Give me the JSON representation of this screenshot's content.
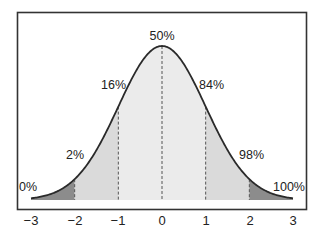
{
  "chart_data": {
    "type": "area",
    "title": "",
    "xlabel": "",
    "ylabel": "",
    "xlim": [
      -3,
      3
    ],
    "x_ticks": [
      -3,
      -2,
      -1,
      0,
      1,
      2,
      3
    ],
    "x_tick_labels": [
      "−3",
      "−2",
      "−1",
      "0",
      "1",
      "2",
      "3"
    ],
    "grid": false,
    "legend": null,
    "region_boundaries": [
      -2,
      -1,
      0,
      1,
      2
    ],
    "regions": [
      {
        "from": -3,
        "to": -2,
        "color": "#8c8c8c"
      },
      {
        "from": -2,
        "to": -1,
        "color": "#dadada"
      },
      {
        "from": -1,
        "to": 0,
        "color": "#ebebeb"
      },
      {
        "from": 0,
        "to": 1,
        "color": "#ebebeb"
      },
      {
        "from": 1,
        "to": 2,
        "color": "#dadada"
      },
      {
        "from": 2,
        "to": 3,
        "color": "#8c8c8c"
      }
    ],
    "percentile_annotations": [
      {
        "z": -3,
        "label": "0%"
      },
      {
        "z": -2,
        "label": "2%"
      },
      {
        "z": -1,
        "label": "16%"
      },
      {
        "z": 0,
        "label": "50%"
      },
      {
        "z": 1,
        "label": "84%"
      },
      {
        "z": 2,
        "label": "98%"
      },
      {
        "z": 3,
        "label": "100%"
      }
    ],
    "curve": "normal pdf, mean 0, sd 1"
  },
  "colors": {
    "frame": "#333333",
    "curve": "#2a2a2a",
    "tail_fill": "#8c8c8c",
    "mid_fill": "#dadada",
    "center_fill": "#ebebeb",
    "dash": "#555555"
  }
}
